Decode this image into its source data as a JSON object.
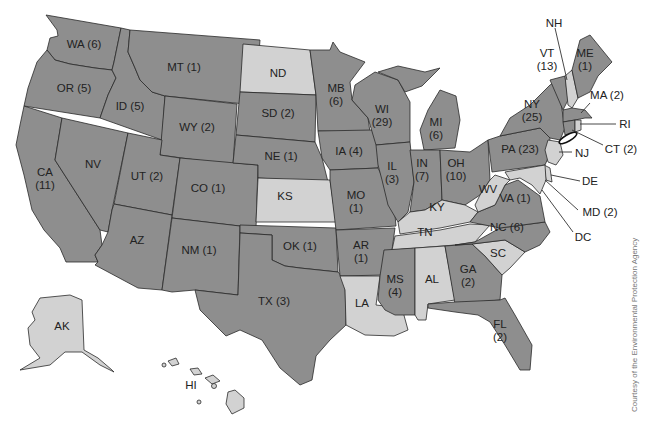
{
  "map": {
    "title": "",
    "colors": {
      "counted": "#8e8e8e",
      "none": "#d2d2d2",
      "border": "#2a2a2a",
      "background": "#ffffff"
    },
    "credit": "Courtesy of the Environmental Protection Agency",
    "states": [
      {
        "abbr": "WA",
        "label": "WA (6)",
        "count": 6
      },
      {
        "abbr": "OR",
        "label": "OR (5)",
        "count": 5
      },
      {
        "abbr": "CA",
        "label": "CA",
        "label2": "(11)",
        "count": 11
      },
      {
        "abbr": "ID",
        "label": "ID (5)",
        "count": 5
      },
      {
        "abbr": "NV",
        "label": "NV",
        "count": null
      },
      {
        "abbr": "MT",
        "label": "MT (1)",
        "count": 1
      },
      {
        "abbr": "WY",
        "label": "WY (2)",
        "count": 2
      },
      {
        "abbr": "UT",
        "label": "UT (2)",
        "count": 2
      },
      {
        "abbr": "AZ",
        "label": "AZ",
        "count": null
      },
      {
        "abbr": "CO",
        "label": "CO (1)",
        "count": 1
      },
      {
        "abbr": "NM",
        "label": "NM (1)",
        "count": 1
      },
      {
        "abbr": "ND",
        "label": "ND",
        "count": null
      },
      {
        "abbr": "SD",
        "label": "SD (2)",
        "count": 2
      },
      {
        "abbr": "NE",
        "label": "NE (1)",
        "count": 1
      },
      {
        "abbr": "KS",
        "label": "KS",
        "count": null
      },
      {
        "abbr": "OK",
        "label": "OK (1)",
        "count": 1
      },
      {
        "abbr": "TX",
        "label": "TX (3)",
        "count": 3
      },
      {
        "abbr": "MB",
        "label": "MB",
        "label2": "(6)",
        "count": 6
      },
      {
        "abbr": "IA",
        "label": "IA (4)",
        "count": 4
      },
      {
        "abbr": "MO",
        "label": "MO",
        "label2": "(1)",
        "count": 1
      },
      {
        "abbr": "AR",
        "label": "AR",
        "label2": "(1)",
        "count": 1
      },
      {
        "abbr": "LA",
        "label": "LA",
        "count": null
      },
      {
        "abbr": "WI",
        "label": "WI",
        "label2": "(29)",
        "count": 29
      },
      {
        "abbr": "IL",
        "label": "IL",
        "label2": "(3)",
        "count": 3
      },
      {
        "abbr": "MI",
        "label": "MI",
        "label2": "(6)",
        "count": 6
      },
      {
        "abbr": "IN",
        "label": "IN",
        "label2": "(7)",
        "count": 7
      },
      {
        "abbr": "OH",
        "label": "OH",
        "label2": "(10)",
        "count": 10
      },
      {
        "abbr": "KY",
        "label": "KY",
        "count": null
      },
      {
        "abbr": "TN",
        "label": "TN",
        "count": null
      },
      {
        "abbr": "MS",
        "label": "MS",
        "label2": "(4)",
        "count": 4
      },
      {
        "abbr": "AL",
        "label": "AL",
        "count": null
      },
      {
        "abbr": "GA",
        "label": "GA",
        "label2": "(2)",
        "count": 2
      },
      {
        "abbr": "FL",
        "label": "FL",
        "label2": "(2)",
        "count": 2
      },
      {
        "abbr": "SC",
        "label": "SC",
        "count": null
      },
      {
        "abbr": "NC",
        "label": "NC (6)",
        "count": 6
      },
      {
        "abbr": "VA",
        "label": "VA (1)",
        "count": 1
      },
      {
        "abbr": "WV",
        "label": "WV",
        "count": null
      },
      {
        "abbr": "PA",
        "label": "PA (23)",
        "count": 23
      },
      {
        "abbr": "NY",
        "label": "NY",
        "label2": "(25)",
        "count": 25
      },
      {
        "abbr": "VT",
        "label": "VT",
        "label2": "(13)",
        "count": 13
      },
      {
        "abbr": "NH",
        "label": "NH",
        "count": null
      },
      {
        "abbr": "ME",
        "label": "ME",
        "label2": "(1)",
        "count": 1
      },
      {
        "abbr": "MA",
        "label": "MA (2)",
        "count": 2
      },
      {
        "abbr": "RI",
        "label": "RI",
        "count": null
      },
      {
        "abbr": "CT",
        "label": "CT (2)",
        "count": 2
      },
      {
        "abbr": "NJ",
        "label": "NJ",
        "count": null
      },
      {
        "abbr": "DE",
        "label": "DE",
        "count": null
      },
      {
        "abbr": "MD",
        "label": "MD (2)",
        "count": 2
      },
      {
        "abbr": "DC",
        "label": "DC",
        "count": null
      },
      {
        "abbr": "AK",
        "label": "AK",
        "count": null
      },
      {
        "abbr": "HI",
        "label": "HI",
        "count": null
      }
    ]
  }
}
